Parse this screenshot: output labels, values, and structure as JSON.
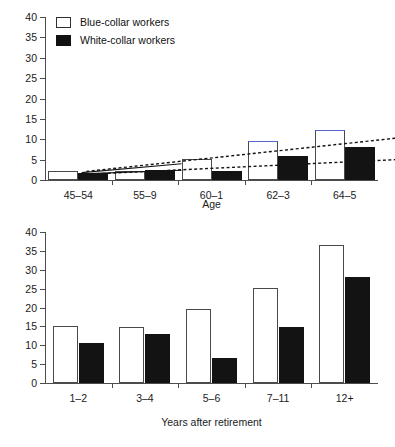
{
  "legend": {
    "position": "top-left",
    "items": [
      {
        "label": "Blue-collar workers",
        "style": "open",
        "swatch_name": "legend-swatch-open"
      },
      {
        "label": "White-collar workers",
        "style": "filled",
        "swatch_name": "legend-swatch-filled"
      }
    ]
  },
  "chart_data": [
    {
      "id": "age-chart",
      "type": "bar",
      "title": "",
      "xlabel": "Age",
      "ylabel": "",
      "categories": [
        "45–54",
        "55–9",
        "60–1",
        "62–3",
        "64–5"
      ],
      "series": [
        {
          "name": "Blue-collar workers",
          "style": "open",
          "values": [
            2.2,
            2.3,
            5.2,
            9.5,
            12.2
          ]
        },
        {
          "name": "White-collar workers",
          "style": "filled",
          "values": [
            1.7,
            2.4,
            2.3,
            6.0,
            8.0
          ]
        }
      ],
      "ylim": [
        0,
        40
      ],
      "yticks": [
        0,
        5,
        10,
        15,
        20,
        25,
        30,
        35,
        40
      ],
      "grid": false,
      "annotations": [
        {
          "name": "trend-upper-dotted",
          "style": "dotted",
          "from": [
            0.12,
            2.1
          ],
          "to": [
            4.9,
            10.5
          ]
        },
        {
          "name": "trend-lower-dotted",
          "style": "dotted",
          "from": [
            0.12,
            1.4
          ],
          "to": [
            4.9,
            5.1
          ]
        },
        {
          "name": "trend-upper-solid",
          "style": "solid",
          "from": [
            0.05,
            1.8
          ],
          "to": [
            1.55,
            4.0
          ]
        },
        {
          "name": "trend-lower-solid",
          "style": "solid",
          "from": [
            0.05,
            1.5
          ],
          "to": [
            1.55,
            2.4
          ]
        }
      ]
    },
    {
      "id": "years-chart",
      "type": "bar",
      "title": "",
      "xlabel": "Years after retirement",
      "ylabel": "",
      "categories": [
        "1–2",
        "3–4",
        "5–6",
        "7–11",
        "12+"
      ],
      "series": [
        {
          "name": "Blue-collar workers",
          "style": "open",
          "values": [
            15.0,
            14.8,
            19.5,
            25.2,
            36.5
          ]
        },
        {
          "name": "White-collar workers",
          "style": "filled",
          "values": [
            10.7,
            13.0,
            6.6,
            14.8,
            28.0
          ]
        }
      ],
      "ylim": [
        0,
        40
      ],
      "yticks": [
        0,
        5,
        10,
        15,
        20,
        25,
        30,
        35,
        40
      ],
      "grid": false,
      "annotations": []
    }
  ],
  "colors": {
    "bar_open_fill": "#ffffff",
    "bar_open_edge": "#4a4a4a",
    "bar_filled": "#131313",
    "bar_cap_accent": "#5566cc",
    "axis": "#4d4d4d",
    "text": "#1a1a1a",
    "background": "#ffffff"
  }
}
